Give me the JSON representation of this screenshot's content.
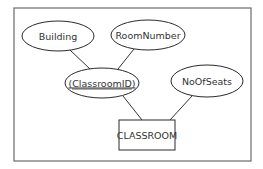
{
  "diagram": {
    "type": "er-diagram",
    "entity": {
      "id": "classroom",
      "label": "CLASSROOM"
    },
    "attributes": [
      {
        "id": "building",
        "label": "Building",
        "key": false
      },
      {
        "id": "room_number",
        "label": "RoomNumber",
        "key": false
      },
      {
        "id": "classroom_id",
        "label": "ClassroomID",
        "display": "(ClassroomID)",
        "key": true,
        "composite": true
      },
      {
        "id": "no_of_seats",
        "label": "NoOfSeats",
        "key": false
      }
    ],
    "edges": [
      {
        "from": "building",
        "to": "classroom_id"
      },
      {
        "from": "room_number",
        "to": "classroom_id"
      },
      {
        "from": "classroom_id",
        "to": "classroom"
      },
      {
        "from": "no_of_seats",
        "to": "classroom"
      }
    ]
  }
}
